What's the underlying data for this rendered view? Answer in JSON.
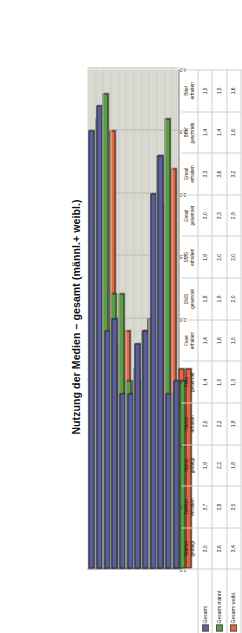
{
  "chart_data": {
    "type": "bar",
    "title": "Nutzung der Medien – gesamt (männl.+ weibl.)",
    "xlabel": "",
    "ylabel": "",
    "ylim": [
      0,
      4.0
    ],
    "grid": true,
    "legend_position": "bottom-left",
    "orientation": "vertical-bars-rendered-rotated",
    "yticks": [
      "4,0",
      "3,5",
      "3,0",
      "2,5",
      "2,0",
      "1,5",
      "1,0",
      "0,5",
      "0,0"
    ],
    "ytick_values": [
      4.0,
      3.5,
      3.0,
      2.5,
      2.0,
      1.5,
      1.0,
      0.5,
      0.0
    ],
    "categories": [
      "Telefon getätigt",
      "Telefon erhalten",
      "Handy getätigt",
      "Handy erhalten",
      "Faxe gesendet",
      "Faxe erhalten",
      "SMS gesendet",
      "SMS erhalten",
      "Email gesendet",
      "Email erhalten",
      "Brief geschrieb.",
      "Brief erhalten"
    ],
    "categories_lines": [
      [
        "Telefon",
        "getätigt"
      ],
      [
        "Telefon",
        "erhalten"
      ],
      [
        "Handy",
        "getätigt"
      ],
      [
        "Handy",
        "erhalten"
      ],
      [
        "Faxe",
        "gesendet"
      ],
      [
        "Faxe",
        "erhalten"
      ],
      [
        "SMS",
        "gesendet"
      ],
      [
        "SMS",
        "erhalten"
      ],
      [
        "Email",
        "gesendet"
      ],
      [
        "Email",
        "erhalten"
      ],
      [
        "Brief",
        "geschrieb."
      ],
      [
        "Brief",
        "erhalten"
      ]
    ],
    "series": [
      {
        "name": "Gesamt",
        "color": "#5b5e9e",
        "values": [
          3.5,
          3.7,
          1.9,
          2.0,
          1.4,
          1.4,
          1.8,
          1.9,
          3.0,
          3.3,
          1.4,
          1.5
        ],
        "labels": [
          "3,5",
          "3,7",
          "1,9",
          "2,0",
          "1,4",
          "1,4",
          "1,8",
          "1,9",
          "3,0",
          "3,3",
          "1,4",
          "1,5"
        ]
      },
      {
        "name": "Gesamt männl.",
        "color": "#58a03f",
        "values": [
          3.6,
          3.8,
          2.2,
          2.2,
          1.5,
          1.6,
          1.9,
          2.0,
          3.3,
          3.6,
          1.4,
          1.5
        ],
        "labels": [
          "3,6",
          "3,8",
          "2,2",
          "2,2",
          "1,5",
          "1,6",
          "1,9",
          "2,0",
          "3,3",
          "3,6",
          "1,4",
          "1,5"
        ]
      },
      {
        "name": "Gesamt weibl.",
        "color": "#e8663c",
        "values": [
          3.4,
          3.5,
          1.8,
          1.9,
          1.5,
          1.5,
          2.0,
          2.0,
          2.9,
          3.2,
          1.6,
          1.6
        ],
        "labels": [
          "3,4",
          "3,5",
          "1,8",
          "1,9",
          "1,5",
          "1,5",
          "2,0",
          "2,0",
          "2,9",
          "3,2",
          "1,6",
          "1,6"
        ]
      }
    ]
  }
}
